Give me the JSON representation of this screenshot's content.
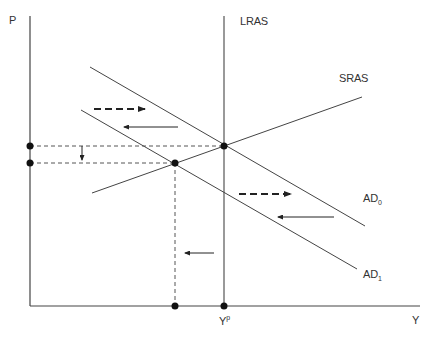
{
  "diagram": {
    "type": "AD-AS model",
    "axes": {
      "y_label": "P",
      "x_label": "Y"
    },
    "curves": {
      "lras": "LRAS",
      "sras": "SRAS",
      "ad0_main": "AD",
      "ad0_sub": "0",
      "ad1_main": "AD",
      "ad1_sub": "1"
    },
    "x_ticks": {
      "potential_main": "Y",
      "potential_sup": "p"
    },
    "colors": {
      "line": "#444444",
      "dot": "#111111",
      "background": "#ffffff"
    }
  }
}
